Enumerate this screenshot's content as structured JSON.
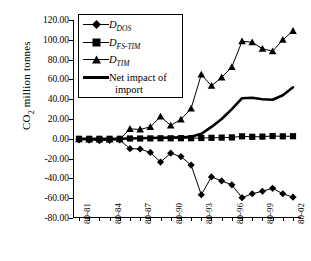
{
  "chart_data": {
    "type": "line",
    "title": "",
    "xlabel": "",
    "ylabel": "CO2 million tonnes",
    "ylim": [
      -80,
      120
    ],
    "ytick_labels": [
      "120.00",
      "100.00",
      "80.00",
      "60.00",
      "40.00",
      "20.00",
      "0.00",
      "-20.00",
      "-40.00",
      "-60.00",
      "-80.00"
    ],
    "ytick_values": [
      120,
      100,
      80,
      60,
      40,
      20,
      0,
      -20,
      -40,
      -60,
      -80
    ],
    "x": [
      "80-81",
      "80-82",
      "80-83",
      "80-84",
      "80-85",
      "80-86",
      "80-87",
      "80-88",
      "80-89",
      "80-90",
      "80-91",
      "80-92",
      "80-93",
      "80-94",
      "80-95",
      "80-96",
      "80-97",
      "80-98",
      "80-99",
      "80-00",
      "80-01",
      "80-02"
    ],
    "xtick_labels": [
      "80-81",
      "80-84",
      "80-87",
      "80-90",
      "80-93",
      "80-96",
      "80-99",
      "80-02"
    ],
    "xtick_indices": [
      0,
      3,
      6,
      9,
      12,
      15,
      18,
      21
    ],
    "grid": false,
    "legend_position": "upper-left-inside",
    "series": [
      {
        "name": "D_DOS",
        "label": "D",
        "sublabel": "DOS",
        "marker": "diamond",
        "values": [
          -1.0,
          -1.3,
          -1.8,
          -1.5,
          -1.2,
          -10.0,
          -10.3,
          -13.8,
          -23.5,
          -14.5,
          -18.0,
          -26.5,
          -56.5,
          -38.5,
          -42.5,
          -46.5,
          -59.5,
          -55.5,
          -53.0,
          -50.0,
          -55.5,
          -59.0
        ]
      },
      {
        "name": "D_FS-TIM",
        "label": "D",
        "sublabel": "FS-TIM",
        "marker": "square",
        "values": [
          0.0,
          0.0,
          0.0,
          0.0,
          0.0,
          0.3,
          0.3,
          0.4,
          0.5,
          0.5,
          0.6,
          0.6,
          0.8,
          1.0,
          1.2,
          1.4,
          2.5,
          2.0,
          2.2,
          2.8,
          2.5,
          2.6
        ]
      },
      {
        "name": "D_TIM",
        "label": "D",
        "sublabel": "TIM",
        "marker": "triangle",
        "values": [
          -0.5,
          -0.6,
          -0.8,
          -0.7,
          -0.5,
          10.0,
          9.5,
          12.0,
          22.5,
          13.5,
          19.5,
          30.5,
          65.0,
          53.5,
          62.0,
          72.5,
          98.5,
          97.5,
          91.0,
          88.5,
          100.0,
          109.0
        ]
      },
      {
        "name": "Net impact of import",
        "label": "Net impact of import",
        "marker": "none",
        "style": "thick-line",
        "values": [
          0.0,
          0.0,
          0.0,
          0.0,
          0.0,
          0.3,
          0.5,
          0.8,
          1.0,
          1.2,
          1.5,
          2.0,
          5.0,
          12.0,
          20.0,
          30.0,
          41.0,
          41.5,
          40.0,
          39.5,
          44.0,
          52.0
        ]
      }
    ]
  },
  "legend": {
    "items": [
      {
        "name": "D_DOS",
        "label": "D",
        "sub": "DOS",
        "marker": "diamond"
      },
      {
        "name": "D_FS-TIM",
        "label": "D",
        "sub": "FS-TIM",
        "marker": "square"
      },
      {
        "name": "D_TIM",
        "label": "D",
        "sub": "TIM",
        "marker": "triangle"
      },
      {
        "name": "net-impact",
        "line1": "Net impact of",
        "line2": "import",
        "marker": "thick-line"
      }
    ]
  },
  "colors": {
    "series": "#000000",
    "axis": "#000000",
    "background": "#ffffff"
  }
}
